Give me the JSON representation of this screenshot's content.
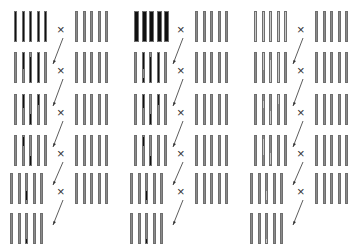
{
  "diagram": {
    "colors": {
      "recurrent": "#8a8a8a",
      "donor_dark": "#111111",
      "donor_light": "#c8c8c8",
      "outline": "#6e6e6e"
    },
    "cross_symbol": "×",
    "panels": [
      {
        "id": "panel-1",
        "donor_color": "#111111",
        "rows": [
          {
            "segments": [
              [
                [
                  0,
                  1
                ]
              ],
              [
                [
                  0,
                  1
                ]
              ],
              [
                [
                  0,
                  1
                ]
              ],
              [
                [
                  0,
                  1
                ]
              ],
              [
                [
                  0,
                  1
                ]
              ]
            ]
          },
          {
            "segments": [
              [],
              [
                [
                  0,
                  0.55
                ]
              ],
              [
                [
                  0.15,
                  1
                ]
              ],
              [
                [
                  0,
                  1
                ]
              ],
              []
            ]
          },
          {
            "segments": [
              [],
              [
                [
                  0,
                  0.45
                ]
              ],
              [
                [
                  0.65,
                  1
                ]
              ],
              [
                [
                  0,
                  0.35
                ]
              ],
              []
            ]
          },
          {
            "segments": [
              [],
              [
                [
                  0.05,
                  0.35
                ]
              ],
              [
                [
                  0.7,
                  1
                ]
              ],
              [],
              []
            ]
          },
          {
            "segments": [
              [],
              [],
              [
                [
                  0.6,
                  0.9
                ]
              ],
              [],
              []
            ]
          },
          {
            "segments": [
              [],
              [],
              [
                [
                  0.85,
                  1
                ]
              ],
              [],
              []
            ]
          }
        ]
      },
      {
        "id": "panel-2",
        "donor_color": "#111111",
        "rows": [
          {
            "segments": [
              [
                [
                  0,
                  1
                ]
              ],
              [
                [
                  0,
                  1
                ]
              ],
              [
                [
                  0,
                  1
                ]
              ],
              [
                [
                  0,
                  1
                ]
              ],
              [
                [
                  0,
                  1
                ]
              ]
            ]
          },
          {
            "segments": [
              [],
              [
                [
                  0,
                  0.55
                ],
                [
                  0.85,
                  1
                ]
              ],
              [
                [
                  0.15,
                  1
                ]
              ],
              [
                [
                  0,
                  1
                ]
              ],
              []
            ]
          },
          {
            "segments": [
              [],
              [
                [
                  0,
                  0.45
                ]
              ],
              [
                [
                  0.65,
                  1
                ]
              ],
              [
                [
                  0,
                  0.35
                ]
              ],
              []
            ]
          },
          {
            "segments": [
              [],
              [
                [
                  0.05,
                  0.35
                ]
              ],
              [
                [
                  0.7,
                  1
                ]
              ],
              [],
              []
            ]
          },
          {
            "segments": [
              [],
              [],
              [
                [
                  0.6,
                  0.9
                ]
              ],
              [],
              []
            ]
          },
          {
            "segments": [
              [],
              [],
              [
                [
                  0.85,
                  1
                ]
              ],
              [],
              []
            ]
          }
        ]
      },
      {
        "id": "panel-3",
        "donor_color": "#c8c8c8",
        "rows": [
          {
            "segments": [
              [
                [
                  0,
                  1
                ]
              ],
              [
                [
                  0,
                  1
                ]
              ],
              [
                [
                  0,
                  1
                ]
              ],
              [
                [
                  0,
                  1
                ]
              ],
              [
                [
                  0,
                  1
                ]
              ]
            ]
          },
          {
            "segments": [
              [],
              [
                [
                  0,
                  0.6
                ]
              ],
              [
                [
                  0.25,
                  1
                ]
              ],
              [
                [
                  0,
                  1
                ]
              ],
              []
            ]
          },
          {
            "segments": [
              [],
              [
                [
                  0.2,
                  0.45
                ]
              ],
              [
                [
                  0.55,
                  1
                ]
              ],
              [
                [
                  0,
                  0.3
                ]
              ],
              []
            ]
          },
          {
            "segments": [
              [],
              [
                [
                  0.1,
                  0.65
                ]
              ],
              [
                [
                  0.6,
                  0.95
                ]
              ],
              [],
              []
            ]
          },
          {
            "segments": [
              [],
              [],
              [
                [
                  0.6,
                  0.9
                ]
              ],
              [],
              []
            ]
          },
          {
            "segments": [
              [],
              [],
              [
                [
                  0.85,
                  1
                ]
              ],
              [],
              []
            ]
          }
        ]
      }
    ]
  }
}
